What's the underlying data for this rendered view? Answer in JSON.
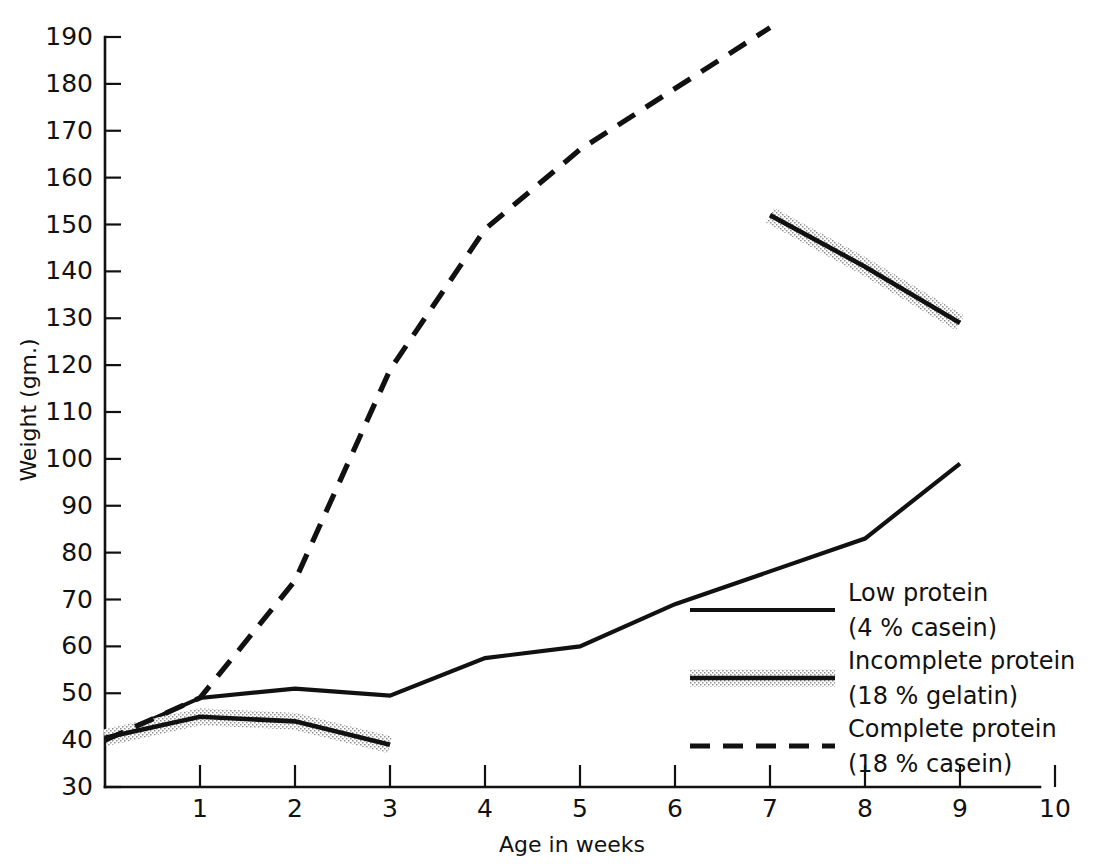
{
  "chart_data": {
    "type": "line",
    "title": "",
    "xlabel": "Age in weeks",
    "ylabel": "Weight (gm.)",
    "xlim": [
      0,
      10
    ],
    "ylim": [
      30,
      190
    ],
    "grid": false,
    "legend_position": "inside-right",
    "x_ticks": [
      "1",
      "2",
      "3",
      "4",
      "5",
      "6",
      "7",
      "8",
      "9",
      "10"
    ],
    "y_ticks": [
      "30",
      "40",
      "50",
      "60",
      "70",
      "80",
      "90",
      "100",
      "110",
      "120",
      "130",
      "140",
      "150",
      "160",
      "170",
      "180",
      "190"
    ],
    "series": [
      {
        "name": "Low protein",
        "sublabel": "(4 % casein)",
        "style": "solid",
        "x": [
          0,
          1,
          2,
          3,
          4,
          5,
          6,
          7,
          8,
          9
        ],
        "values": [
          40,
          49,
          51,
          49.5,
          57.5,
          60,
          69,
          76,
          83,
          99
        ]
      },
      {
        "name": "Incomplete protein",
        "sublabel": "(18 % gelatin)",
        "style": "solid-shaded",
        "segments": [
          {
            "x": [
              0,
              1,
              2,
              3
            ],
            "values": [
              40.5,
              45,
              44,
              39
            ]
          },
          {
            "x": [
              7,
              8,
              9
            ],
            "values": [
              152,
              141,
              129
            ]
          }
        ]
      },
      {
        "name": "Complete protein",
        "sublabel": "(18 % casein)",
        "style": "dashed",
        "x": [
          0,
          1,
          2,
          3,
          4,
          5,
          6,
          7
        ],
        "values": [
          40,
          49,
          74,
          119,
          149,
          166,
          179,
          192
        ]
      }
    ],
    "colors": {
      "ink": "#111111",
      "background": "#ffffff",
      "stipple": "#9a9a9a"
    }
  },
  "legend": {
    "entries": [
      {
        "label": "Low protein",
        "sublabel": "(4 % casein)",
        "swatch": "solid-line-swatch"
      },
      {
        "label": "Incomplete protein",
        "sublabel": "(18 % gelatin)",
        "swatch": "shaded-line-swatch"
      },
      {
        "label": "Complete protein",
        "sublabel": "(18 % casein)",
        "swatch": "dashed-line-swatch"
      }
    ]
  }
}
